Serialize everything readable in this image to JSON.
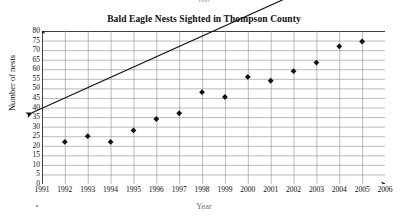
{
  "page": {
    "top_ghost_text": "Year",
    "corner_mark": "•"
  },
  "chart_data": {
    "type": "scatter",
    "title": "Bald Eagle Nests Sighted in Thompson County",
    "xlabel": "Year",
    "ylabel": "Number of nests",
    "xlim": [
      1991,
      2006
    ],
    "ylim": [
      0,
      80
    ],
    "grid": true,
    "legend": "none",
    "x_ticks": [
      "1991",
      "1992",
      "1993",
      "1994",
      "1995",
      "1996",
      "1997",
      "1998",
      "1999",
      "2000",
      "2001",
      "2002",
      "2003",
      "2004",
      "2005",
      "2006"
    ],
    "y_ticks": [
      "0",
      "5",
      "10",
      "15",
      "20",
      "25",
      "30",
      "35",
      "40",
      "45",
      "50",
      "55",
      "60",
      "65",
      "70",
      "75",
      "80"
    ],
    "x": [
      1992,
      1993,
      1994,
      1995,
      1996,
      1997,
      1998,
      1999,
      2000,
      2001,
      2002,
      2003,
      2004,
      2005
    ],
    "values": [
      22,
      25,
      22,
      28,
      34,
      37,
      48,
      45.5,
      56,
      54,
      59,
      63.5,
      72,
      74.5
    ],
    "series": [
      {
        "name": "Nests sighted",
        "marker": "filled-diamond",
        "color": "#111111",
        "points": [
          {
            "year": 1992,
            "nests": 22
          },
          {
            "year": 1993,
            "nests": 25
          },
          {
            "year": 1994,
            "nests": 22
          },
          {
            "year": 1995,
            "nests": 28
          },
          {
            "year": 1996,
            "nests": 34
          },
          {
            "year": 1997,
            "nests": 37
          },
          {
            "year": 1998,
            "nests": 48
          },
          {
            "year": 1999,
            "nests": 45.5
          },
          {
            "year": 2000,
            "nests": 56
          },
          {
            "year": 2001,
            "nests": 54
          },
          {
            "year": 2002,
            "nests": 59
          },
          {
            "year": 2003,
            "nests": 63.5
          },
          {
            "year": 2004,
            "nests": 72
          },
          {
            "year": 2005,
            "nests": 74.5
          }
        ]
      }
    ],
    "annotations": [
      {
        "name": "trend-line",
        "type": "double-headed-arrow",
        "from": {
          "year": 1992.4,
          "nests": 21
        },
        "to": {
          "year": 2005.2,
          "nests": 90
        },
        "color": "#111111"
      }
    ]
  }
}
